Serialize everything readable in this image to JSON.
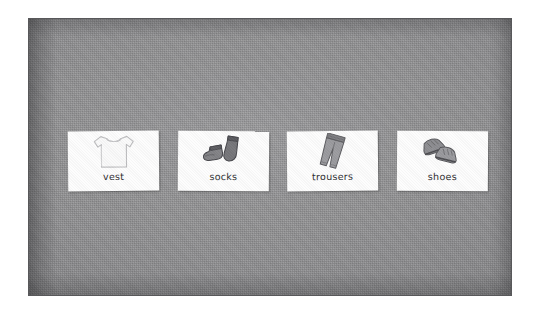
{
  "photo": {
    "caption_surface": "grey textured board",
    "background_color": "#8e8e90",
    "border_color": "#58585a",
    "page_color": "#ffffff"
  },
  "cards": [
    {
      "label": "vest",
      "icon": "t-shirt-icon",
      "art_color": "#f2f2f2",
      "outline_color": "#b9b9bb"
    },
    {
      "label": "socks",
      "icon": "socks-icon",
      "art_color": "#6f6f71",
      "outline_color": "#4a4a4c"
    },
    {
      "label": "trousers",
      "icon": "trousers-icon",
      "art_color": "#9a9a9c",
      "outline_color": "#6d6d6f"
    },
    {
      "label": "shoes",
      "icon": "shoes-icon",
      "art_color": "#8a8a8c",
      "outline_color": "#5d5d5f"
    }
  ]
}
